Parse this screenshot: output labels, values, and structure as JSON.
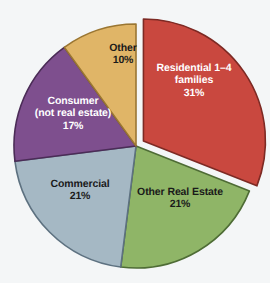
{
  "chart_data": {
    "type": "pie",
    "title": "",
    "subtitle": "",
    "xlabel": "",
    "ylabel": "",
    "legend_position": "none",
    "grid": false,
    "units": "percent",
    "start_angle_deg": 0,
    "direction": "clockwise",
    "categories": [
      "Residential 1–4 families",
      "Other Real Estate",
      "Commercial",
      "Consumer (not real estate)",
      "Other"
    ],
    "values": [
      31,
      21,
      21,
      17,
      10
    ],
    "slices": [
      {
        "key": "residential",
        "label_lines": [
          "Residential 1–4",
          "families"
        ],
        "label_text": "Residential 1–4 families",
        "value": 31,
        "value_label": "31%",
        "color": "#c9483f",
        "edge_color": "#7d2a24",
        "text_color": "#ffffff",
        "exploded": true
      },
      {
        "key": "other-real-estate",
        "label_lines": [
          "Other Real Estate"
        ],
        "label_text": "Other Real Estate",
        "value": 21,
        "value_label": "21%",
        "color": "#8fb567",
        "edge_color": "#4e6c35",
        "text_color": "#1a1a1a",
        "exploded": false
      },
      {
        "key": "commercial",
        "label_lines": [
          "Commercial"
        ],
        "label_text": "Commercial",
        "value": 21,
        "value_label": "21%",
        "color": "#a5b8c4",
        "edge_color": "#5d7180",
        "text_color": "#1a1a1a",
        "exploded": false
      },
      {
        "key": "consumer",
        "label_lines": [
          "Consumer",
          "(not real estate)"
        ],
        "label_text": "Consumer (not real estate)",
        "value": 17,
        "value_label": "17%",
        "color": "#7e4f8e",
        "edge_color": "#4b2c57",
        "text_color": "#ffffff",
        "exploded": false
      },
      {
        "key": "other",
        "label_lines": [
          "Other"
        ],
        "label_text": "Other",
        "value": 10,
        "value_label": "10%",
        "color": "#e0b567",
        "edge_color": "#9a7632",
        "text_color": "#1a1a1a",
        "exploded": false
      }
    ],
    "background_color": "#f4f6f7"
  }
}
